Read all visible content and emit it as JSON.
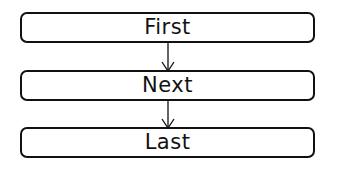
{
  "diagram": {
    "nodes": [
      {
        "label": "First"
      },
      {
        "label": "Next"
      },
      {
        "label": "Last"
      }
    ],
    "edges": [
      {
        "from": "First",
        "to": "Next"
      },
      {
        "from": "Next",
        "to": "Last"
      }
    ],
    "colors": {
      "stroke": "#111111",
      "background": "#ffffff"
    }
  }
}
